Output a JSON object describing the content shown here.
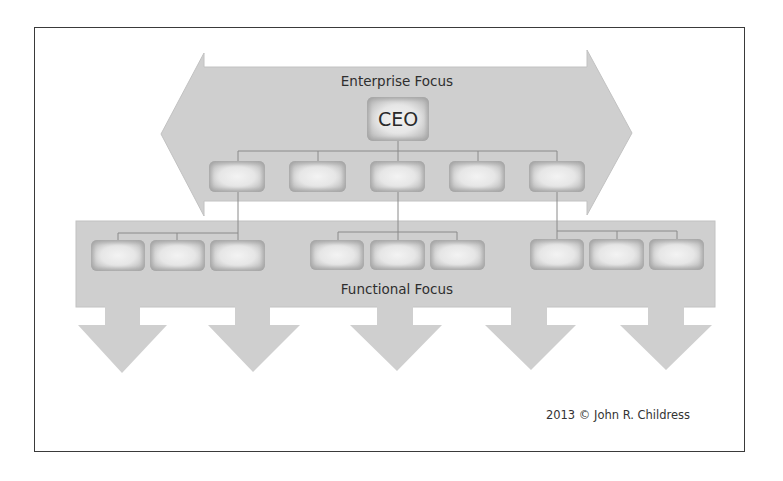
{
  "diagram": {
    "title_top": "Enterprise Focus",
    "title_bottom": "Functional Focus",
    "copyright": "2013 © John R. Childress",
    "root_node": {
      "label": "CEO"
    },
    "colors": {
      "arrow_fill": "#cfcfcf",
      "box_fill": "#e8e8e8",
      "box_border": "#9d9d9d",
      "connector": "#8a8a8a",
      "frame": "#3a3a3a",
      "text": "#2e2e2e"
    },
    "enterprise_level": {
      "direction": "left-right double arrow",
      "nodes": [
        {
          "label": ""
        },
        {
          "label": ""
        },
        {
          "label": ""
        },
        {
          "label": ""
        },
        {
          "label": ""
        }
      ]
    },
    "functional_level": {
      "direction": "downward arrows",
      "arrow_count": 5,
      "groups": [
        {
          "parent_index": 0,
          "nodes": [
            {
              "label": ""
            },
            {
              "label": ""
            },
            {
              "label": ""
            }
          ]
        },
        {
          "parent_index": 2,
          "nodes": [
            {
              "label": ""
            },
            {
              "label": ""
            },
            {
              "label": ""
            }
          ]
        },
        {
          "parent_index": 4,
          "nodes": [
            {
              "label": ""
            },
            {
              "label": ""
            },
            {
              "label": ""
            }
          ]
        }
      ]
    }
  }
}
